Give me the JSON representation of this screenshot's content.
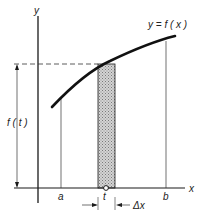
{
  "diagram": {
    "axes": {
      "x_label": "x",
      "y_label": "y"
    },
    "curve_label": "y = f ( x )",
    "height_label": "f ( t )",
    "points": {
      "a": "a",
      "t": "t",
      "b": "b"
    },
    "width_label": "Δx",
    "colors": {
      "line": "#1a1a1a",
      "shade": "#bdbdbd",
      "background": "#ffffff"
    }
  }
}
